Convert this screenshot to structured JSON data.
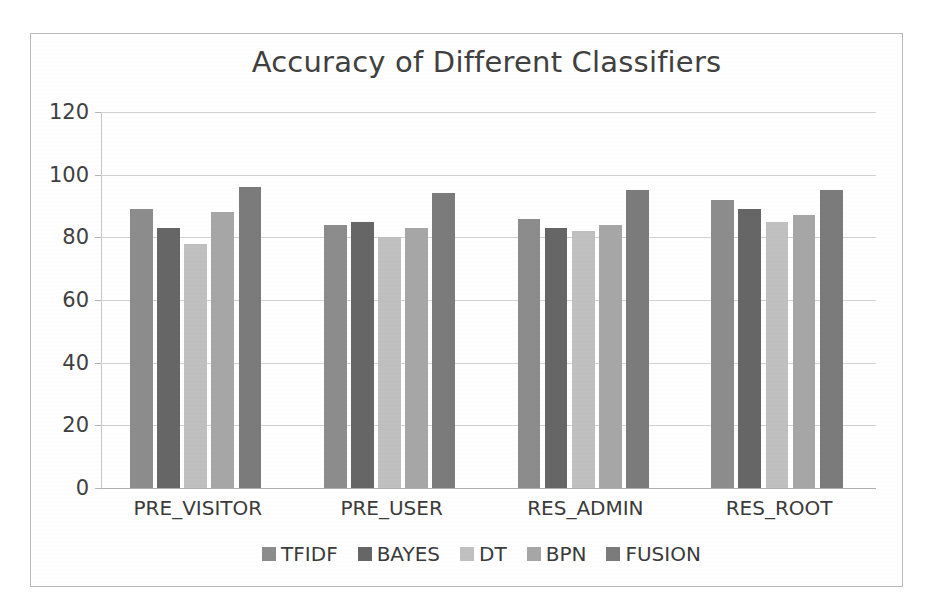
{
  "chart_data": {
    "type": "bar",
    "title": "Accuracy of Different Classifiers",
    "xlabel": "",
    "ylabel": "",
    "ylim": [
      0,
      120
    ],
    "yticks": [
      0,
      20,
      40,
      60,
      80,
      100,
      120
    ],
    "ytick_labels": [
      "0",
      "20",
      "40",
      "60",
      "80",
      "100",
      "120"
    ],
    "grid": true,
    "legend_position": "bottom",
    "categories": [
      "PRE_VISITOR",
      "PRE_USER",
      "RES_ADMIN",
      "RES_ROOT"
    ],
    "series": [
      {
        "name": "TFIDF",
        "color": "#8c8c8c",
        "values": [
          89,
          84,
          86,
          92
        ]
      },
      {
        "name": "BAYES",
        "color": "#666666",
        "values": [
          83,
          85,
          83,
          89
        ]
      },
      {
        "name": "DT",
        "color": "#c0c0c0",
        "values": [
          78,
          80,
          82,
          85
        ]
      },
      {
        "name": "BPN",
        "color": "#a6a6a6",
        "values": [
          88,
          83,
          84,
          87
        ]
      },
      {
        "name": "FUSION",
        "color": "#7b7b7b",
        "values": [
          96,
          94,
          95,
          95
        ]
      }
    ]
  },
  "colors": {
    "frame": "#b9b9b9",
    "gridline": "#d2d2d2",
    "text": "#3f3f3f",
    "title": "#404040",
    "background": "#ffffff"
  }
}
